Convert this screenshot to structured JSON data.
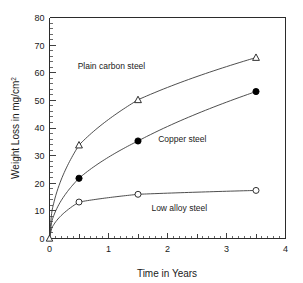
{
  "chart_data": {
    "type": "line",
    "title": "",
    "xlabel": "Time in Years",
    "ylabel": "Weight Loss in mg/cm",
    "ylabel_superscript": "2",
    "xlim": [
      0,
      4
    ],
    "ylim": [
      0,
      80
    ],
    "xticks": [
      0,
      1,
      2,
      3,
      4
    ],
    "xtick_labels": [
      "0",
      "1",
      "2",
      "3",
      "4"
    ],
    "x_minor_step": 0.1,
    "yticks": [
      0,
      10,
      20,
      30,
      40,
      50,
      60,
      70,
      80
    ],
    "ytick_labels": [
      "0",
      "10",
      "20",
      "30",
      "40",
      "50",
      "60",
      "70",
      "80"
    ],
    "y_minor_step": 2,
    "grid": false,
    "legend_position": "inline-annotations",
    "series": [
      {
        "name": "Plain carbon steel",
        "marker": "open-triangle",
        "x": [
          0,
          0.5,
          1.5,
          3.5
        ],
        "values": [
          0,
          33.8,
          50.2,
          65.5
        ],
        "label_x": 1.05,
        "label_y": 61.5
      },
      {
        "name": "Copper steel",
        "marker": "filled-circle",
        "x": [
          0,
          0.5,
          1.5,
          3.5
        ],
        "values": [
          0,
          21.8,
          35.3,
          53.2
        ],
        "label_x": 2.25,
        "label_y": 35.0
      },
      {
        "name": "Low alloy steel",
        "marker": "open-circle",
        "x": [
          0,
          0.5,
          1.5,
          3.5
        ],
        "values": [
          0,
          13.2,
          16.0,
          17.4
        ],
        "label_x": 2.2,
        "label_y": 10.0
      }
    ],
    "annotations": [
      {
        "text": "Plain carbon steel"
      },
      {
        "text": "Copper steel"
      },
      {
        "text": "Low alloy steel"
      }
    ],
    "colors": {
      "axis": "#2b2b2b",
      "curve": "#3a3a3a",
      "marker_fill_open": "#ffffff",
      "marker_fill_solid": "#000000",
      "background": "#ffffff",
      "text": "#1a1a1a"
    }
  }
}
